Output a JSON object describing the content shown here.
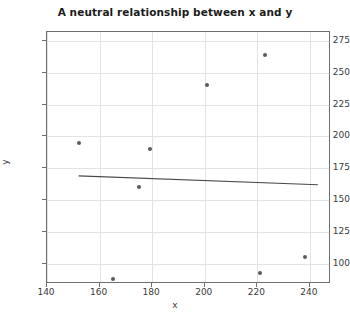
{
  "chart_data": {
    "type": "scatter",
    "title": "A neutral relationship between x and y",
    "xlabel": "x",
    "ylabel": "y",
    "xlim": [
      140,
      248
    ],
    "ylim": [
      84,
      282
    ],
    "xticks": [
      140,
      160,
      180,
      200,
      220,
      240
    ],
    "yticks": [
      100,
      125,
      150,
      175,
      200,
      225,
      250,
      275
    ],
    "grid": true,
    "legend": "none",
    "point_color": "#5a5a5a",
    "line_color": "#4a4a4a",
    "points": [
      {
        "x": 152,
        "y": 195
      },
      {
        "x": 165,
        "y": 88
      },
      {
        "x": 175,
        "y": 160
      },
      {
        "x": 179,
        "y": 190
      },
      {
        "x": 201,
        "y": 240
      },
      {
        "x": 221,
        "y": 93
      },
      {
        "x": 223,
        "y": 264
      },
      {
        "x": 238,
        "y": 105
      }
    ],
    "trend_line": {
      "label": "linear fit",
      "x_start": 152,
      "y_start": 169,
      "x_end": 243,
      "y_end": 162
    }
  }
}
